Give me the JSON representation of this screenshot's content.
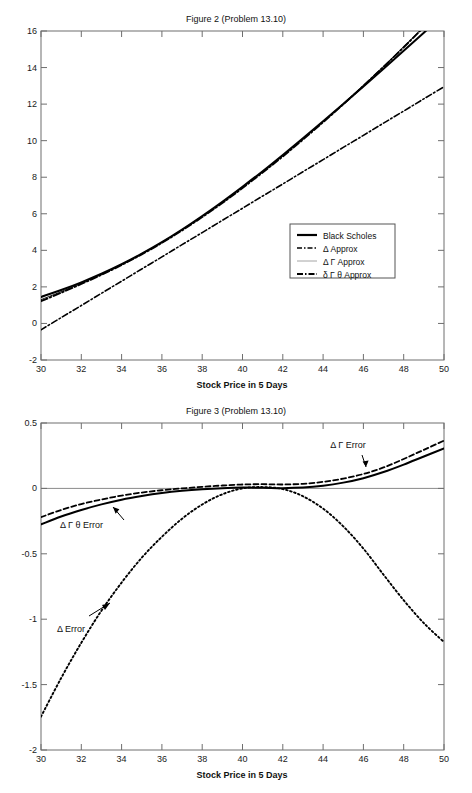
{
  "figures": [
    {
      "id": "figure-2",
      "title": "Figure 2 (Problem 13.10)",
      "xlabel": "Stock Price in 5 Days",
      "ylabel": "",
      "xticks": [
        "30",
        "32",
        "34",
        "36",
        "38",
        "40",
        "42",
        "44",
        "46",
        "48",
        "50"
      ],
      "yticks": [
        "-2",
        "0",
        "2",
        "4",
        "6",
        "8",
        "10",
        "12",
        "14",
        "16"
      ],
      "legend": [
        {
          "label": "Black Scholes",
          "style": "solid"
        },
        {
          "label": "Δ Approx",
          "style": "dashdot"
        },
        {
          "label": "Δ Γ Approx",
          "style": "thin-solid"
        },
        {
          "label": "δ Γ θ Approx",
          "style": "dashdot-bold"
        }
      ]
    },
    {
      "id": "figure-3",
      "title": "Figure 3 (Problem 13.10)",
      "xlabel": "Stock Price in 5 Days",
      "ylabel": "",
      "xticks": [
        "30",
        "32",
        "34",
        "36",
        "38",
        "40",
        "42",
        "44",
        "46",
        "48",
        "50"
      ],
      "yticks": [
        "-2",
        "-1.5",
        "-1",
        "-0.5",
        "0",
        "0.5"
      ],
      "annotations": [
        {
          "text": "Δ Γ Error",
          "x": 45.0,
          "y": 0.4
        },
        {
          "text": "Δ Γ θ Error",
          "x": 31.5,
          "y": -0.28
        },
        {
          "text": "Δ Error",
          "x": 34.0,
          "y": -1.05
        }
      ]
    }
  ],
  "chart_data": [
    {
      "type": "line",
      "title": "Figure 2 (Problem 13.10)",
      "xlabel": "Stock Price in 5 Days",
      "ylabel": "",
      "xlim": [
        30,
        50
      ],
      "ylim": [
        -2,
        16
      ],
      "grid": false,
      "legend_position": "center-right",
      "x": [
        30,
        31,
        32,
        33,
        34,
        35,
        36,
        37,
        38,
        39,
        40,
        41,
        42,
        43,
        44,
        45,
        46,
        47,
        48,
        49,
        50
      ],
      "series": [
        {
          "name": "Black Scholes",
          "style": "solid",
          "values": [
            1.45,
            1.83,
            2.25,
            2.72,
            3.24,
            3.82,
            4.45,
            5.14,
            5.88,
            6.66,
            7.48,
            8.33,
            9.22,
            10.13,
            11.06,
            12.01,
            12.97,
            13.94,
            14.92,
            15.91,
            16.9
          ]
        },
        {
          "name": "Δ Approx",
          "style": "dashdot",
          "values": [
            -0.35,
            0.32,
            0.98,
            1.65,
            2.31,
            2.98,
            3.64,
            4.31,
            4.97,
            5.64,
            6.3,
            6.97,
            7.63,
            8.3,
            8.96,
            9.63,
            10.29,
            10.96,
            11.62,
            12.29,
            12.95
          ]
        },
        {
          "name": "Δ Γ Approx",
          "style": "thin-solid",
          "values": [
            1.3,
            1.74,
            2.2,
            2.69,
            3.22,
            3.8,
            4.43,
            5.11,
            5.85,
            6.62,
            7.44,
            8.29,
            9.17,
            10.09,
            11.04,
            12.02,
            13.03,
            14.07,
            15.14,
            16.24,
            17.36
          ]
        },
        {
          "name": "δ Γ θ Approx",
          "style": "dashdot-bold",
          "values": [
            1.22,
            1.68,
            2.16,
            2.66,
            3.2,
            3.78,
            4.41,
            5.09,
            5.82,
            6.59,
            7.41,
            8.26,
            9.14,
            10.06,
            11.01,
            11.99,
            13.0,
            14.04,
            15.11,
            16.21,
            17.33
          ]
        }
      ]
    },
    {
      "type": "line",
      "title": "Figure 3 (Problem 13.10)",
      "xlabel": "Stock Price in 5 Days",
      "ylabel": "",
      "xlim": [
        30,
        50
      ],
      "ylim": [
        -2,
        0.5
      ],
      "grid": false,
      "legend_position": "none",
      "x": [
        30,
        31,
        32,
        33,
        34,
        35,
        36,
        37,
        38,
        39,
        40,
        41,
        42,
        43,
        44,
        45,
        46,
        47,
        48,
        49,
        50
      ],
      "series": [
        {
          "name": "Δ Γ Error",
          "style": "dashed",
          "values": [
            -0.22,
            -0.165,
            -0.12,
            -0.085,
            -0.055,
            -0.032,
            -0.014,
            0.0,
            0.012,
            0.022,
            0.03,
            0.032,
            0.03,
            0.035,
            0.05,
            0.075,
            0.11,
            0.16,
            0.225,
            0.295,
            0.365
          ]
        },
        {
          "name": "Δ Γ θ Error",
          "style": "solid",
          "values": [
            -0.275,
            -0.215,
            -0.165,
            -0.122,
            -0.086,
            -0.058,
            -0.035,
            -0.018,
            -0.006,
            0.002,
            0.006,
            0.005,
            0.002,
            0.006,
            0.02,
            0.044,
            0.078,
            0.125,
            0.182,
            0.244,
            0.305
          ]
        },
        {
          "name": "Δ Error",
          "style": "dotted",
          "values": [
            -1.745,
            -1.45,
            -1.18,
            -0.935,
            -0.72,
            -0.53,
            -0.37,
            -0.232,
            -0.123,
            -0.045,
            0.0,
            0.01,
            -0.005,
            -0.06,
            -0.155,
            -0.29,
            -0.46,
            -0.66,
            -0.855,
            -1.03,
            -1.175
          ]
        }
      ]
    }
  ]
}
